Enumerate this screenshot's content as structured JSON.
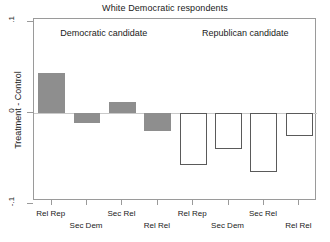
{
  "chart_data": {
    "type": "bar",
    "title": "White Democratic respondents",
    "xlabel": "",
    "ylabel": "Treatment - Control",
    "ylim": [
      -0.1,
      0.1
    ],
    "yticks": [
      0.1,
      0,
      -0.1
    ],
    "ytick_labels": [
      ".1",
      "0",
      "-.1"
    ],
    "grid": false,
    "legend": "none",
    "panels": [
      {
        "name": "Democratic candidate",
        "style": "filled-gray",
        "categories": [
          "Rel Rep",
          "Sec Dem",
          "Sec Rel",
          "Rel Rel"
        ],
        "values": [
          0.044,
          -0.011,
          0.012,
          -0.02
        ]
      },
      {
        "name": "Republican candidate",
        "style": "hollow-outline",
        "categories": [
          "Rel Rep",
          "Sec Dem",
          "Sec Rel",
          "Rel Rel"
        ],
        "values": [
          -0.057,
          -0.04,
          -0.065,
          -0.025
        ]
      }
    ]
  },
  "colors": {
    "filled_bar": "#8e8e8e",
    "hollow_bar_border": "#5a5a5a",
    "axis": "#9a9a9a",
    "zero_line": "#c9c9c9",
    "text": "#1a1a1a",
    "background": "#ffffff"
  }
}
